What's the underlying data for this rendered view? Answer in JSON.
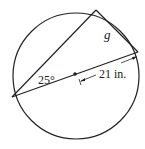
{
  "diagram": {
    "type": "geometry-circle",
    "labels": {
      "angle": "25°",
      "chord": "g",
      "radius": "21 in."
    },
    "colors": {
      "stroke": "#222222",
      "background": "#ffffff"
    }
  }
}
